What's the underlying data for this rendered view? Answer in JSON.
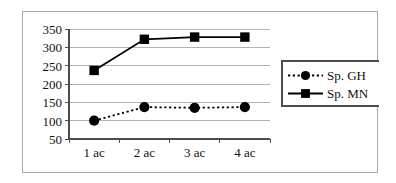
{
  "chart_data": {
    "type": "line",
    "title": "",
    "subtitle": "",
    "xlabel": "",
    "ylabel": "",
    "categories": [
      "1 ac",
      "2 ac",
      "3 ac",
      "4 ac"
    ],
    "series": [
      {
        "name": "Sp. GH",
        "values": [
          100,
          137,
          135,
          137
        ],
        "marker": "circle",
        "line_style": "dotted",
        "color": "#000000"
      },
      {
        "name": "Sp. MN",
        "values": [
          237,
          322,
          328,
          328
        ],
        "marker": "square",
        "line_style": "solid",
        "color": "#000000"
      }
    ],
    "ylim": [
      50,
      350
    ],
    "y_ticks": [
      350,
      300,
      250,
      200,
      150,
      100,
      50
    ],
    "y_tick_labels": [
      "350",
      "300",
      "250",
      "200",
      "150",
      "100",
      "50"
    ],
    "x_tick_labels": [
      "1 ac",
      "2 ac",
      "3 ac",
      "4 ac"
    ],
    "grid": {
      "horizontal": true,
      "vertical": false,
      "color": "#b3b3b3"
    },
    "legend": {
      "position": "right",
      "border": true,
      "entries": [
        {
          "label": "Sp. GH",
          "marker": "circle",
          "line_style": "dotted"
        },
        {
          "label": "Sp. MN",
          "marker": "square",
          "line_style": "solid"
        }
      ]
    },
    "axis_color": "#4d4d4d",
    "plot_background": "#ffffff",
    "frame_border_color": "#a9a9a9"
  }
}
